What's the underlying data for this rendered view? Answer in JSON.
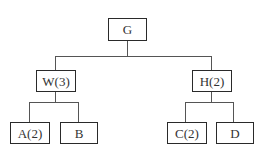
{
  "diagram": {
    "type": "tree",
    "root": {
      "label": "G",
      "children": [
        {
          "label": "W(3)",
          "children": [
            {
              "label": "A(2)"
            },
            {
              "label": "B"
            }
          ]
        },
        {
          "label": "H(2)",
          "children": [
            {
              "label": "C(2)"
            },
            {
              "label": "D"
            }
          ]
        }
      ]
    },
    "nodes": {
      "g": "G",
      "w": "W(3)",
      "h": "H(2)",
      "a": "A(2)",
      "b": "B",
      "c": "C(2)",
      "d": "D"
    },
    "colors": {
      "border": "#2a2a2a",
      "line": "#555555",
      "text": "#333333",
      "background": "#ffffff"
    }
  }
}
